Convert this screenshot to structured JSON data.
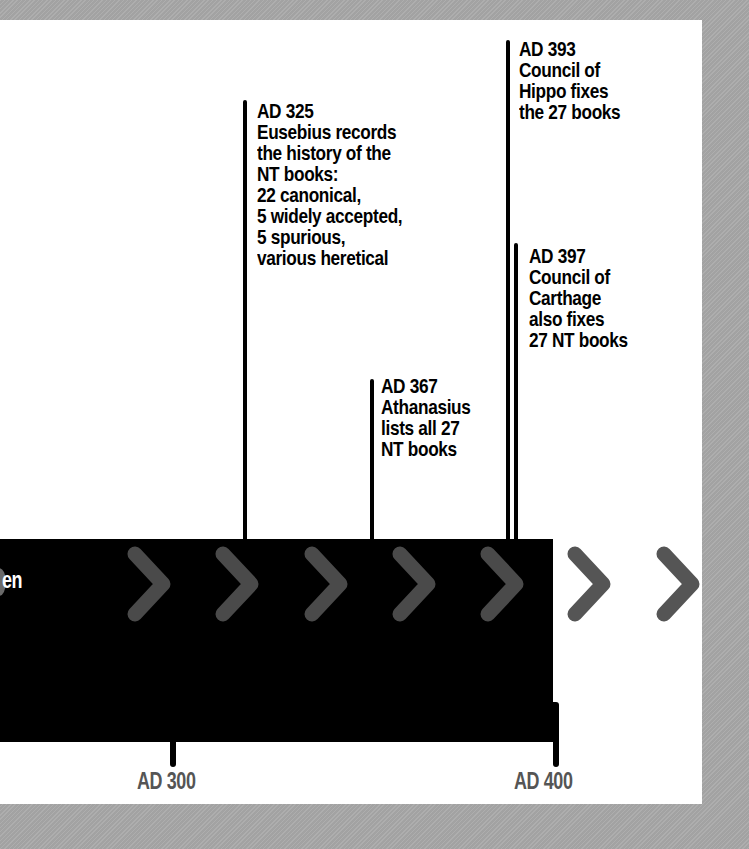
{
  "timeline": {
    "band_label": "en",
    "colors": {
      "background": "#a9a9a9",
      "panel": "#ffffff",
      "band": "#000000",
      "chevron_on_band": "#4a4a4a",
      "chevron_on_panel": "#555555",
      "axis_label": "#555555",
      "event_text": "#000000"
    },
    "chevron_count": 7,
    "events": [
      {
        "year": "AD 325",
        "lines": [
          "Eusebius records",
          "the history of the",
          "NT books:",
          "22 canonical,",
          "5 widely accepted,",
          "5 spurious,",
          "various heretical"
        ]
      },
      {
        "year": "AD 367",
        "lines": [
          "Athanasius",
          "lists all 27",
          "NT books"
        ]
      },
      {
        "year": "AD 393",
        "lines": [
          "Council of",
          "Hippo fixes",
          "the 27 books"
        ]
      },
      {
        "year": "AD 397",
        "lines": [
          "Council of",
          "Carthage",
          "also fixes",
          "27 NT books"
        ]
      }
    ],
    "axis": [
      {
        "label": "AD 300"
      },
      {
        "label": "AD 400"
      }
    ]
  }
}
